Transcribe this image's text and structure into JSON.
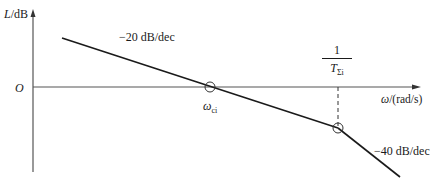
{
  "diagram": {
    "type": "bode-magnitude-asymptotic-plot",
    "y_axis": {
      "label_var": "L",
      "label_unit": "/dB"
    },
    "x_axis": {
      "label_var": "ω",
      "label_unit": "/(rad/s)"
    },
    "origin_label": "O",
    "segments": [
      {
        "slope_label": "−20 dB/dec"
      },
      {
        "slope_label": "−40 dB/dec"
      }
    ],
    "crossover": {
      "label_var": "ω",
      "label_sub": "ci"
    },
    "corner": {
      "numerator": "1",
      "denominator_var": "T",
      "denominator_sub": "Σi"
    },
    "colors": {
      "line": "#1a1a1a",
      "axis": "#555555",
      "background": "#ffffff"
    }
  }
}
